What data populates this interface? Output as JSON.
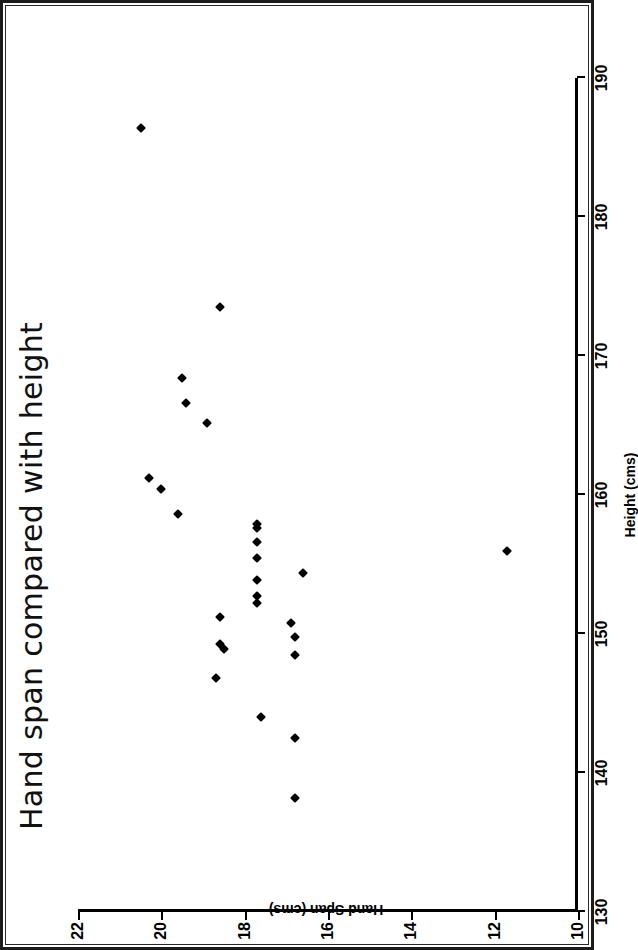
{
  "figure": {
    "title": "Hand span compared with height",
    "background_color": "#ffffff",
    "ink_color": "#000000",
    "page_border_color": "#1c1c1c",
    "page_rotation_degrees": -90
  },
  "chart_data": {
    "type": "scatter",
    "title": "Hand span compared with height",
    "xlabel": "Height (cms)",
    "ylabel": "Hand Span (cms)",
    "xlim": [
      130,
      190
    ],
    "ylim": [
      10,
      22
    ],
    "xticks": [
      130,
      140,
      150,
      160,
      170,
      180,
      190
    ],
    "yticks": [
      10,
      12,
      14,
      16,
      18,
      20,
      22
    ],
    "xtick_labels": [
      "130",
      "140",
      "150",
      "160",
      "170",
      "180",
      "190"
    ],
    "ytick_labels": [
      "10",
      "12",
      "14",
      "16",
      "18",
      "20",
      "22"
    ],
    "grid": false,
    "legend": null,
    "marker": "diamond",
    "marker_color": "#000000",
    "marker_size_px": 7,
    "n_points": 27,
    "x": [
      186.4,
      173.5,
      168.4,
      166.6,
      165.2,
      161.2,
      160.4,
      158.6,
      157.9,
      157.6,
      156.6,
      155.5,
      154.4,
      153.9,
      152.7,
      152.2,
      151.2,
      150.8,
      149.8,
      149.3,
      148.9,
      148.5,
      146.8,
      144.0,
      142.5,
      138.2,
      156.0
    ],
    "y": [
      20.5,
      18.6,
      19.5,
      19.4,
      18.9,
      20.3,
      20.0,
      19.6,
      17.7,
      17.7,
      17.7,
      17.7,
      16.6,
      17.7,
      17.7,
      17.7,
      18.6,
      16.9,
      16.8,
      18.6,
      18.5,
      16.8,
      18.7,
      17.6,
      16.8,
      16.8,
      11.7
    ],
    "points": [
      {
        "height": 186.4,
        "hand_span": 20.5
      },
      {
        "height": 173.5,
        "hand_span": 18.6
      },
      {
        "height": 168.4,
        "hand_span": 19.5
      },
      {
        "height": 166.6,
        "hand_span": 19.4
      },
      {
        "height": 165.2,
        "hand_span": 18.9
      },
      {
        "height": 161.2,
        "hand_span": 20.3
      },
      {
        "height": 160.4,
        "hand_span": 20.0
      },
      {
        "height": 158.6,
        "hand_span": 19.6
      },
      {
        "height": 157.9,
        "hand_span": 17.7
      },
      {
        "height": 157.6,
        "hand_span": 17.7
      },
      {
        "height": 156.6,
        "hand_span": 17.7
      },
      {
        "height": 155.5,
        "hand_span": 17.7
      },
      {
        "height": 154.4,
        "hand_span": 16.6
      },
      {
        "height": 153.9,
        "hand_span": 17.7
      },
      {
        "height": 152.7,
        "hand_span": 17.7
      },
      {
        "height": 152.2,
        "hand_span": 17.7
      },
      {
        "height": 151.2,
        "hand_span": 18.6
      },
      {
        "height": 150.8,
        "hand_span": 16.9
      },
      {
        "height": 149.8,
        "hand_span": 16.8
      },
      {
        "height": 149.3,
        "hand_span": 18.6
      },
      {
        "height": 148.9,
        "hand_span": 18.5
      },
      {
        "height": 148.5,
        "hand_span": 16.8
      },
      {
        "height": 146.8,
        "hand_span": 18.7
      },
      {
        "height": 144.0,
        "hand_span": 17.6
      },
      {
        "height": 142.5,
        "hand_span": 16.8
      },
      {
        "height": 138.2,
        "hand_span": 16.8
      },
      {
        "height": 156.0,
        "hand_span": 11.7
      }
    ]
  }
}
